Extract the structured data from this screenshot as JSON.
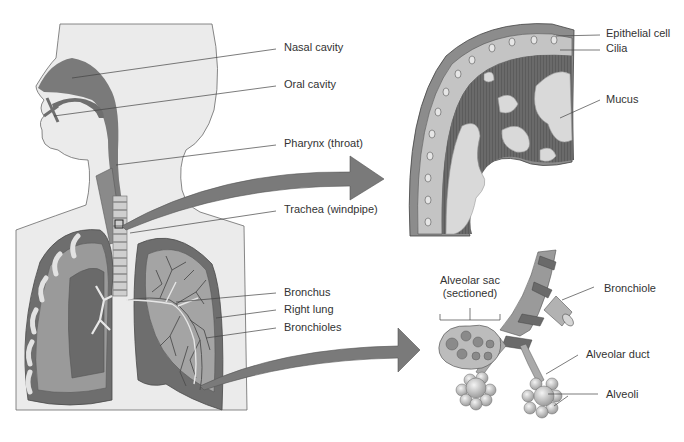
{
  "diagram": {
    "colors": {
      "skin": "#ebebeb",
      "outline": "#6a6a6a",
      "cavity": "#6e6e6e",
      "lung_dark": "#5e5e5e",
      "lung_mid": "#8a8a8a",
      "lung_light": "#b4b4b4",
      "arrow": "#7a7a7a",
      "leader_line": "#444444",
      "text": "#333333",
      "mucus": "#d9d9d9",
      "cilia": "#5a5a5a"
    },
    "body_labels": [
      {
        "id": "nasal-cavity",
        "text": "Nasal cavity"
      },
      {
        "id": "oral-cavity",
        "text": "Oral cavity"
      },
      {
        "id": "pharynx",
        "text": "Pharynx (throat)"
      },
      {
        "id": "trachea",
        "text": "Trachea (windpipe)"
      },
      {
        "id": "bronchus",
        "text": "Bronchus"
      },
      {
        "id": "right-lung",
        "text": "Right lung"
      },
      {
        "id": "bronchioles",
        "text": "Bronchioles"
      }
    ],
    "epithelium_labels": [
      {
        "id": "epithelial-cell",
        "text": "Epithelial cell"
      },
      {
        "id": "cilia",
        "text": "Cilia"
      },
      {
        "id": "mucus",
        "text": "Mucus"
      }
    ],
    "alveoli_labels": [
      {
        "id": "alveolar-sac",
        "text": "Alveolar sac",
        "subtext": "(sectioned)"
      },
      {
        "id": "bronchiole",
        "text": "Bronchiole"
      },
      {
        "id": "alveolar-duct",
        "text": "Alveolar duct"
      },
      {
        "id": "alveoli",
        "text": "Alveoli"
      }
    ]
  }
}
